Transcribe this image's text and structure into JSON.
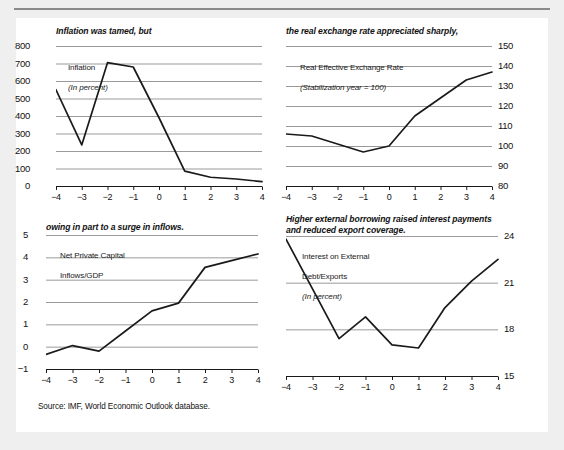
{
  "figure": {
    "source_note": "Source: IMF, World Economic Outlook database.",
    "ghost_header": "",
    "axis_x_label_set": [
      "-4",
      "-3",
      "-2",
      "-1",
      "0",
      "1",
      "2",
      "3",
      "4"
    ]
  },
  "chart_data": [
    {
      "id": "inflation",
      "type": "line",
      "title": "Inflation was tamed, but",
      "series_label_line1": "Inflation",
      "series_label_line2": "(In percent)",
      "x": [
        -4,
        -3,
        -2,
        -1,
        0,
        1,
        2,
        3,
        4
      ],
      "values": [
        550,
        235,
        705,
        680,
        390,
        85,
        50,
        40,
        25
      ],
      "categories": [
        "-4",
        "-3",
        "-2",
        "-1",
        "0",
        "1",
        "2",
        "3",
        "4"
      ],
      "yticks": [
        0,
        100,
        200,
        300,
        400,
        500,
        600,
        700,
        800
      ],
      "ylim": [
        0,
        800
      ],
      "xlim": [
        -4,
        4
      ],
      "xlabel": "",
      "ylabel": "",
      "y_axis_side": "left",
      "grid": true,
      "legend": "none"
    },
    {
      "id": "real-exchange-rate",
      "type": "line",
      "title": "the real exchange rate appreciated sharply,",
      "series_label_line1": "Real Effective Exchange Rate",
      "series_label_line2": "(Stabilization year = 100)",
      "x": [
        -4,
        -3,
        -2,
        -1,
        0,
        1,
        2,
        3,
        4
      ],
      "values": [
        106,
        105,
        101,
        97,
        100,
        115,
        124,
        133,
        137
      ],
      "categories": [
        "-4",
        "-3",
        "-2",
        "-1",
        "0",
        "1",
        "2",
        "3",
        "4"
      ],
      "yticks": [
        80,
        90,
        100,
        110,
        120,
        130,
        140,
        150
      ],
      "ylim": [
        80,
        150
      ],
      "xlim": [
        -4,
        4
      ],
      "xlabel": "",
      "ylabel": "",
      "y_axis_side": "right",
      "grid": true,
      "legend": "none"
    },
    {
      "id": "net-private-capital-inflows",
      "type": "line",
      "title": "owing in part to a surge in inflows.",
      "series_label_line1": "Net Private Capital",
      "series_label_line2": "Inflows/GDP",
      "x": [
        -4,
        -3,
        -2,
        -1,
        0,
        1,
        2,
        3,
        4
      ],
      "values": [
        -0.35,
        0.05,
        -0.2,
        0.7,
        1.6,
        1.95,
        3.55,
        3.85,
        4.15
      ],
      "categories": [
        "-4",
        "-3",
        "-2",
        "-1",
        "0",
        "1",
        "2",
        "3",
        "4"
      ],
      "yticks": [
        -1,
        0,
        1,
        2,
        3,
        4,
        5
      ],
      "ylim": [
        -1,
        5
      ],
      "xlim": [
        -4,
        4
      ],
      "xlabel": "",
      "ylabel": "",
      "y_axis_side": "left",
      "grid": true,
      "legend": "none"
    },
    {
      "id": "interest-on-external-debt",
      "type": "line",
      "title": "Higher external borrowing raised interest payments\nand reduced export coverage.",
      "series_label_line1": "Interest on External",
      "series_label_line2": "Debt/Exports",
      "series_label_line3": "(In percent)",
      "x": [
        -4,
        -3,
        -2,
        -1,
        0,
        1,
        2,
        3,
        4
      ],
      "values": [
        23.8,
        20.6,
        17.4,
        18.8,
        17.0,
        16.8,
        19.4,
        21.1,
        22.5
      ],
      "categories": [
        "-4",
        "-3",
        "-2",
        "-1",
        "0",
        "1",
        "2",
        "3",
        "4"
      ],
      "yticks": [
        15,
        18,
        21,
        24
      ],
      "ylim": [
        15,
        24
      ],
      "xlim": [
        -4,
        4
      ],
      "xlabel": "",
      "ylabel": "",
      "y_axis_side": "right",
      "grid": true,
      "legend": "none"
    }
  ],
  "colors": {
    "line": "#1a1a1a",
    "grid": "#8f8f8f",
    "axis": "#1a1a1a",
    "panel_bg": "#ffffff",
    "page_bg": "#efefef",
    "text": "#111111"
  }
}
